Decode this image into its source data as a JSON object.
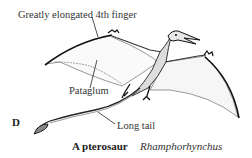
{
  "figure": {
    "panel_letter": "D",
    "caption_bold": "A pterosaur",
    "caption_italic": "Rhamphorhynchus",
    "labels": {
      "finger": "Greatly elongated 4th finger",
      "patagium": "Pataglum",
      "tail": "Long tail"
    }
  }
}
